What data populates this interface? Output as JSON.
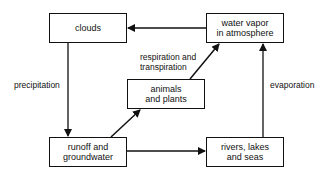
{
  "diagram": {
    "nodes": [
      {
        "id": "clouds",
        "label": "clouds"
      },
      {
        "id": "water_vapor",
        "label": "water vapor\nin atmosphere"
      },
      {
        "id": "animals_plants",
        "label": "animals\nand plants"
      },
      {
        "id": "runoff",
        "label": "runoff and\ngroundwater"
      },
      {
        "id": "rivers",
        "label": "rivers, lakes\nand seas"
      }
    ],
    "edges": [
      {
        "from": "water_vapor",
        "to": "clouds",
        "label": ""
      },
      {
        "from": "clouds",
        "to": "runoff",
        "label": "precipitation"
      },
      {
        "from": "runoff",
        "to": "animals_plants",
        "label": ""
      },
      {
        "from": "animals_plants",
        "to": "water_vapor",
        "label": "respiration and\ntranspiration"
      },
      {
        "from": "runoff",
        "to": "rivers",
        "label": ""
      },
      {
        "from": "rivers",
        "to": "water_vapor",
        "label": "evaporation"
      }
    ]
  },
  "labels": {
    "clouds": "clouds",
    "water_vapor_1": "water vapor",
    "water_vapor_2": "in atmosphere",
    "animals_1": "animals",
    "animals_2": "and plants",
    "runoff_1": "runoff and",
    "runoff_2": "groundwater",
    "rivers_1": "rivers, lakes",
    "rivers_2": "and seas",
    "precipitation": "precipitation",
    "respiration_1": "respiration and",
    "respiration_2": "transpiration",
    "evaporation": "evaporation"
  }
}
